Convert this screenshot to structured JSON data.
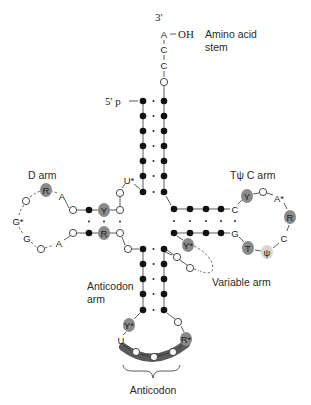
{
  "diagram": {
    "colors": {
      "shaded_nucleotide": "#8a8a8a",
      "anticodon_band": "#5a5a5a",
      "psi_shade": "#d6d6d6",
      "line": "#333333"
    },
    "labels": {
      "three_prime": "3'",
      "oh": "OH",
      "amino_acid_stem_line1": "Amino acid",
      "amino_acid_stem_line2": "stem",
      "five_prime": "5' p",
      "d_arm": "D arm",
      "tpsic_arm": "Tψ C arm",
      "variable_arm": "Variable arm",
      "anticodon_arm_line1": "Anticodon",
      "anticodon_arm_line2": "arm",
      "anticodon": "Anticodon"
    },
    "acceptor_tail": [
      "A",
      "C",
      "C",
      "O"
    ],
    "acceptor_stem_pairs": 7,
    "d_arm": {
      "stem_top": [
        "O",
        "●",
        "Y",
        "O"
      ],
      "stem_bottom": [
        "O",
        "●",
        "R",
        "O"
      ],
      "loop": [
        "A",
        "R",
        "O",
        "G*",
        "G",
        "O",
        "A"
      ],
      "connector": [
        "U*",
        "O"
      ]
    },
    "tpsic_arm": {
      "stem_top_end": "C",
      "stem_bottom_end": "G",
      "loop": [
        "Y",
        "O",
        "A*",
        "R",
        "C",
        "ψ",
        "T"
      ]
    },
    "variable_arm": {
      "nucleotides": [
        "Y*",
        "O",
        "O"
      ]
    },
    "anticodon_stem_pairs": 5,
    "anticodon_loop": {
      "nucleotides": [
        "Y*",
        "U",
        "O",
        "O",
        "O",
        "R*",
        "O"
      ],
      "anticodon_triplet": [
        "O",
        "O",
        "O"
      ]
    }
  }
}
